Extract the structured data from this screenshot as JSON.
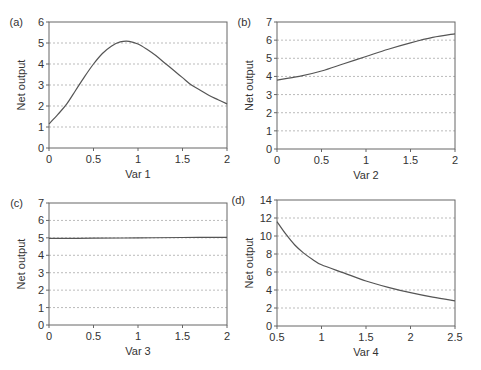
{
  "figure": {
    "line_color": "#555555",
    "grid_color": "#aaaaaa",
    "axis_color": "#666666"
  },
  "chart_data": [
    {
      "panel": "(a)",
      "type": "line",
      "xlabel": "Var 1",
      "ylabel": "Net output",
      "xlim": [
        0,
        2
      ],
      "ylim": [
        0,
        6
      ],
      "xticks": [
        0,
        0.5,
        1,
        1.5,
        2
      ],
      "xtick_labels": [
        "0",
        "0.5",
        "1",
        "1.5",
        "2"
      ],
      "yticks": [
        0,
        1,
        2,
        3,
        4,
        5,
        6
      ],
      "ytick_labels": [
        "0",
        "1",
        "2",
        "3",
        "4",
        "5",
        "6"
      ],
      "grid": "horizontal dotted",
      "box": {
        "x0": 49,
        "x1": 227,
        "y_top": 22,
        "y_bottom": 148
      },
      "x": [
        0,
        0.1,
        0.2,
        0.3,
        0.4,
        0.5,
        0.6,
        0.7,
        0.8,
        0.9,
        1.0,
        1.1,
        1.2,
        1.3,
        1.4,
        1.5,
        1.6,
        1.7,
        1.8,
        1.9,
        2.0
      ],
      "values": [
        1.15,
        1.6,
        2.1,
        2.75,
        3.4,
        4.0,
        4.5,
        4.85,
        5.05,
        5.08,
        4.95,
        4.7,
        4.4,
        4.05,
        3.7,
        3.35,
        3.0,
        2.75,
        2.5,
        2.3,
        2.1
      ]
    },
    {
      "panel": "(b)",
      "type": "line",
      "xlabel": "Var 2",
      "ylabel": "Net output",
      "xlim": [
        0,
        2
      ],
      "ylim": [
        0,
        7
      ],
      "xticks": [
        0,
        0.5,
        1,
        1.5,
        2
      ],
      "xtick_labels": [
        "0",
        "0.5",
        "1",
        "1.5",
        "2"
      ],
      "yticks": [
        0,
        1,
        2,
        3,
        4,
        5,
        6,
        7
      ],
      "ytick_labels": [
        "0",
        "1",
        "2",
        "3",
        "4",
        "5",
        "6",
        "7"
      ],
      "grid": "horizontal dotted",
      "box": {
        "x0": 277,
        "x1": 455,
        "y_top": 22,
        "y_bottom": 149
      },
      "x": [
        0,
        0.25,
        0.5,
        0.75,
        1.0,
        1.25,
        1.5,
        1.75,
        2.0
      ],
      "values": [
        3.8,
        4.0,
        4.3,
        4.7,
        5.1,
        5.5,
        5.85,
        6.15,
        6.35
      ]
    },
    {
      "panel": "(c)",
      "type": "line",
      "xlabel": "Var 3",
      "ylabel": "Net output",
      "xlim": [
        0,
        2
      ],
      "ylim": [
        0,
        7
      ],
      "xticks": [
        0,
        0.5,
        1,
        1.5,
        2
      ],
      "xtick_labels": [
        "0",
        "0.5",
        "1",
        "1.5",
        "2"
      ],
      "yticks": [
        0,
        1,
        2,
        3,
        4,
        5,
        6,
        7
      ],
      "ytick_labels": [
        "0",
        "1",
        "2",
        "3",
        "4",
        "5",
        "6",
        "7"
      ],
      "grid": "horizontal dotted",
      "box": {
        "x0": 49,
        "x1": 227,
        "y_top": 203,
        "y_bottom": 325
      },
      "x": [
        0,
        0.5,
        1.0,
        1.5,
        2.0
      ],
      "values": [
        4.97,
        4.98,
        5.0,
        5.02,
        5.03
      ]
    },
    {
      "panel": "(d)",
      "type": "line",
      "xlabel": "Var 4",
      "ylabel": "Net output",
      "xlim": [
        0.5,
        2.5
      ],
      "ylim": [
        0,
        14
      ],
      "xticks": [
        0.5,
        1,
        1.5,
        2,
        2.5
      ],
      "xtick_labels": [
        "0.5",
        "1",
        "1.5",
        "2",
        "2.5"
      ],
      "yticks": [
        0,
        2,
        4,
        6,
        8,
        10,
        12,
        14
      ],
      "ytick_labels": [
        "0",
        "2",
        "4",
        "6",
        "8",
        "10",
        "12",
        "14"
      ],
      "grid": "horizontal dotted",
      "box": {
        "x0": 277,
        "x1": 455,
        "y_top": 200,
        "y_bottom": 326
      },
      "x": [
        0.5,
        0.6,
        0.7,
        0.8,
        0.9,
        1.0,
        1.25,
        1.5,
        1.75,
        2.0,
        2.25,
        2.5
      ],
      "values": [
        11.6,
        10.2,
        9.0,
        8.1,
        7.4,
        6.8,
        5.9,
        5.0,
        4.3,
        3.7,
        3.2,
        2.8
      ]
    }
  ]
}
